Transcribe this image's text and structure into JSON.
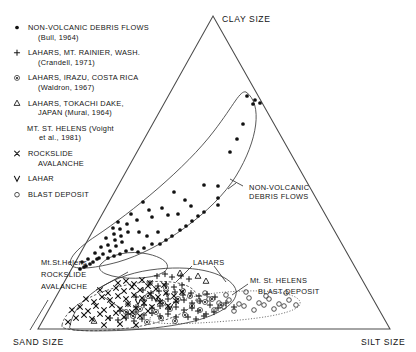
{
  "figure": {
    "type": "ternary-scatter",
    "corners": {
      "top": "CLAY SIZE",
      "bottom_left": "SAND SIZE",
      "bottom_right": "SILT SIZE"
    },
    "legend": [
      {
        "symbol": "filled-dot",
        "glyph": "•",
        "lines": [
          "NON-VOLCANIC DEBRIS FLOWS",
          "(Bull, 1964)"
        ]
      },
      {
        "symbol": "plus",
        "glyph": "+",
        "lines": [
          "LAHARS, MT. RAINIER, WASH.",
          "(Crandell, 1971)"
        ]
      },
      {
        "symbol": "circled-dot",
        "glyph": "⊚",
        "lines": [
          "LAHARS, IRAZU, COSTA RICA",
          "(Waldron, 1967)"
        ]
      },
      {
        "symbol": "triangle",
        "glyph": "△",
        "lines": [
          "LAHARS, TOKACHI DAKE,",
          "JAPAN (Murai, 1964)"
        ]
      },
      {
        "symbol": "none",
        "glyph": "",
        "lines": [
          "MT. ST. HELENS (Voight",
          "et al., 1981)"
        ]
      },
      {
        "symbol": "cross-x",
        "glyph": "×",
        "lines": [
          "ROCKSLIDE",
          "AVALANCHE"
        ]
      },
      {
        "symbol": "vee",
        "glyph": "∨",
        "lines": [
          "LAHAR"
        ]
      },
      {
        "symbol": "open-circle",
        "glyph": "○",
        "lines": [
          "BLAST DEPOSIT"
        ]
      }
    ],
    "annotations": [
      {
        "id": "nvdf",
        "lines": [
          "NON-VOLCANIC",
          "DEBRIS FLOWS"
        ]
      },
      {
        "id": "rockslide",
        "lines": [
          "Mt.St.Helens",
          "ROCKSLIDE",
          "AVALANCHE"
        ]
      },
      {
        "id": "lahars",
        "lines": [
          "LAHARS"
        ]
      },
      {
        "id": "blast",
        "lines": [
          "Mt. St. HELENS",
          "BLAST DEPOSIT"
        ]
      }
    ],
    "colors": {
      "ink": "#141414",
      "axis": "#4a4a4a",
      "envelope": "#3b3b3b",
      "background": "#ffffff"
    }
  },
  "chart_data": {
    "type": "scatter",
    "title": "",
    "xlabel": "SAND SIZE – SILT SIZE",
    "ylabel": "CLAY SIZE",
    "grid": false,
    "legend_position": "upper-left",
    "axis_note": "Ternary diagram: apex = CLAY SIZE, lower-left = SAND SIZE, lower-right = SILT SIZE",
    "series": [
      {
        "name": "NON-VOLCANIC DEBRIS FLOWS (Bull, 1964)",
        "symbol": "filled-dot",
        "points": [
          [
            247,
            96
          ],
          [
            255,
            100
          ],
          [
            260,
            103
          ],
          [
            253,
            104
          ],
          [
            243,
            124
          ],
          [
            237,
            139
          ],
          [
            230,
            152
          ],
          [
            204,
            185
          ],
          [
            218,
            186
          ],
          [
            218,
            198
          ],
          [
            218,
            205
          ],
          [
            174,
            192
          ],
          [
            185,
            200
          ],
          [
            191,
            206
          ],
          [
            162,
            208
          ],
          [
            168,
            215
          ],
          [
            178,
            214
          ],
          [
            143,
            202
          ],
          [
            149,
            210
          ],
          [
            152,
            217
          ],
          [
            131,
            214
          ],
          [
            137,
            220
          ],
          [
            127,
            224
          ],
          [
            128,
            232
          ],
          [
            139,
            232
          ],
          [
            147,
            236
          ],
          [
            158,
            232
          ],
          [
            118,
            222
          ],
          [
            120,
            229
          ],
          [
            121,
            236
          ],
          [
            122,
            242
          ],
          [
            113,
            228
          ],
          [
            114,
            234
          ],
          [
            115,
            240
          ],
          [
            116,
            246
          ],
          [
            106,
            238
          ],
          [
            108,
            245
          ],
          [
            110,
            251
          ],
          [
            101,
            247
          ],
          [
            103,
            254
          ],
          [
            99,
            258
          ],
          [
            95,
            253
          ],
          [
            97,
            259
          ],
          [
            93,
            262
          ],
          [
            88,
            259
          ],
          [
            90,
            264
          ],
          [
            86,
            266
          ],
          [
            82,
            262
          ],
          [
            84,
            267
          ],
          [
            80,
            269
          ],
          [
            108,
            258
          ],
          [
            114,
            256
          ],
          [
            120,
            254
          ],
          [
            126,
            251
          ],
          [
            132,
            249
          ],
          [
            138,
            252
          ],
          [
            144,
            248
          ],
          [
            152,
            244
          ],
          [
            160,
            244
          ],
          [
            166,
            240
          ],
          [
            172,
            236
          ],
          [
            180,
            230
          ],
          [
            186,
            226
          ],
          [
            192,
            221
          ],
          [
            198,
            216
          ],
          [
            204,
            212
          ]
        ]
      },
      {
        "name": "LAHARS, MT. RAINIER, WASH. (Crandell, 1971)",
        "symbol": "plus",
        "points": [
          [
            157,
            276
          ],
          [
            165,
            274
          ],
          [
            172,
            277
          ],
          [
            181,
            276
          ],
          [
            189,
            279
          ],
          [
            150,
            283
          ],
          [
            158,
            286
          ],
          [
            166,
            284
          ],
          [
            174,
            287
          ],
          [
            182,
            285
          ],
          [
            143,
            290
          ],
          [
            151,
            293
          ],
          [
            159,
            291
          ],
          [
            167,
            294
          ],
          [
            175,
            292
          ],
          [
            183,
            295
          ],
          [
            191,
            293
          ],
          [
            199,
            296
          ],
          [
            207,
            294
          ],
          [
            215,
            297
          ],
          [
            136,
            297
          ],
          [
            144,
            300
          ],
          [
            152,
            298
          ],
          [
            160,
            301
          ],
          [
            168,
            299
          ],
          [
            176,
            302
          ],
          [
            184,
            300
          ],
          [
            192,
            303
          ],
          [
            200,
            301
          ],
          [
            128,
            304
          ],
          [
            136,
            307
          ],
          [
            144,
            305
          ],
          [
            152,
            308
          ],
          [
            160,
            306
          ],
          [
            168,
            309
          ],
          [
            176,
            307
          ],
          [
            184,
            310
          ],
          [
            192,
            308
          ],
          [
            120,
            311
          ],
          [
            128,
            314
          ],
          [
            136,
            312
          ],
          [
            144,
            315
          ],
          [
            152,
            313
          ],
          [
            160,
            316
          ],
          [
            168,
            314
          ],
          [
            176,
            317
          ],
          [
            110,
            318
          ],
          [
            118,
            320
          ],
          [
            126,
            318
          ],
          [
            134,
            321
          ],
          [
            142,
            319
          ],
          [
            210,
            305
          ],
          [
            218,
            308
          ],
          [
            226,
            303
          ],
          [
            234,
            307
          ],
          [
            198,
            311
          ],
          [
            206,
            314
          ],
          [
            214,
            312
          ],
          [
            188,
            317
          ],
          [
            196,
            319
          ],
          [
            204,
            316
          ]
        ]
      },
      {
        "name": "LAHARS, IRAZU, COSTA RICA (Waldron, 1967)",
        "symbol": "circled-dot",
        "points": [
          [
            148,
            296
          ],
          [
            163,
            303
          ],
          [
            178,
            299
          ],
          [
            192,
            306
          ],
          [
            156,
            312
          ],
          [
            170,
            309
          ],
          [
            185,
            315
          ],
          [
            200,
            310
          ],
          [
            140,
            309
          ],
          [
            133,
            316
          ],
          [
            126,
            312
          ],
          [
            205,
            302
          ],
          [
            212,
            299
          ],
          [
            221,
            305
          ],
          [
            175,
            321
          ],
          [
            161,
            318
          ],
          [
            147,
            322
          ],
          [
            190,
            296
          ],
          [
            183,
            291
          ],
          [
            166,
            288
          ]
        ]
      },
      {
        "name": "LAHARS, TOKACHI DAKE, JAPAN (Murai, 1964)",
        "symbol": "triangle",
        "points": [
          [
            94,
            321
          ],
          [
            198,
            276
          ],
          [
            206,
            281
          ],
          [
            180,
            273
          ]
        ]
      },
      {
        "name": "MT. ST. HELENS ROCKSLIDE AVALANCHE",
        "symbol": "cross-x",
        "points": [
          [
            76,
            318
          ],
          [
            84,
            315
          ],
          [
            92,
            319
          ],
          [
            100,
            314
          ],
          [
            108,
            318
          ],
          [
            116,
            313
          ],
          [
            124,
            317
          ],
          [
            132,
            312
          ],
          [
            140,
            316
          ],
          [
            148,
            311
          ],
          [
            72,
            310
          ],
          [
            80,
            307
          ],
          [
            88,
            311
          ],
          [
            96,
            306
          ],
          [
            104,
            310
          ],
          [
            112,
            305
          ],
          [
            120,
            309
          ],
          [
            128,
            304
          ],
          [
            136,
            308
          ],
          [
            144,
            303
          ],
          [
            152,
            307
          ],
          [
            160,
            302
          ],
          [
            168,
            306
          ],
          [
            176,
            301
          ],
          [
            86,
            299
          ],
          [
            94,
            302
          ],
          [
            102,
            297
          ],
          [
            110,
            300
          ],
          [
            118,
            296
          ],
          [
            126,
            299
          ],
          [
            134,
            295
          ],
          [
            142,
            298
          ],
          [
            150,
            294
          ],
          [
            158,
            297
          ],
          [
            166,
            293
          ],
          [
            174,
            296
          ],
          [
            182,
            292
          ],
          [
            100,
            290
          ],
          [
            108,
            293
          ],
          [
            116,
            288
          ],
          [
            124,
            291
          ],
          [
            132,
            287
          ],
          [
            140,
            290
          ],
          [
            148,
            286
          ],
          [
            156,
            289
          ],
          [
            164,
            285
          ],
          [
            118,
            283
          ],
          [
            126,
            281
          ],
          [
            134,
            284
          ],
          [
            142,
            280
          ],
          [
            150,
            283
          ],
          [
            68,
            322
          ],
          [
            104,
            325
          ],
          [
            120,
            324
          ],
          [
            136,
            325
          ]
        ]
      },
      {
        "name": "MT. ST. HELENS LAHAR",
        "symbol": "vee",
        "points": [
          [
            138,
            302
          ],
          [
            156,
            299
          ],
          [
            170,
            307
          ]
        ]
      },
      {
        "name": "MT. ST. HELENS BLAST DEPOSIT",
        "symbol": "open-circle",
        "points": [
          [
            199,
            301
          ],
          [
            209,
            299
          ],
          [
            219,
            303
          ],
          [
            229,
            300
          ],
          [
            239,
            304
          ],
          [
            249,
            298
          ],
          [
            259,
            303
          ],
          [
            269,
            299
          ],
          [
            279,
            304
          ],
          [
            289,
            300
          ],
          [
            296,
            305
          ],
          [
            214,
            310
          ],
          [
            224,
            307
          ],
          [
            234,
            311
          ],
          [
            244,
            306
          ],
          [
            254,
            310
          ],
          [
            264,
            305
          ],
          [
            274,
            309
          ],
          [
            284,
            306
          ],
          [
            205,
            293
          ],
          [
            226,
            295
          ],
          [
            246,
            292
          ],
          [
            266,
            296
          ],
          [
            286,
            293
          ]
        ]
      }
    ]
  }
}
